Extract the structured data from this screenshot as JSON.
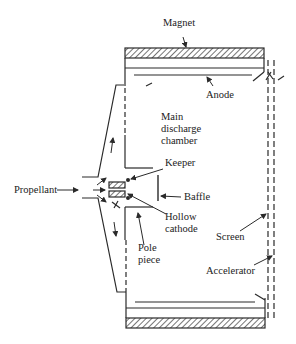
{
  "diagram": {
    "labels": {
      "magnet": "Magnet",
      "anode": "Anode",
      "main_chamber_1": "Main",
      "main_chamber_2": "discharge",
      "main_chamber_3": "chamber",
      "keeper": "Keeper",
      "propellant": "Propellant",
      "baffle": "Baffle",
      "hollow_cathode_1": "Hollow",
      "hollow_cathode_2": "cathode",
      "pole_piece_1": "Pole",
      "pole_piece_2": "piece",
      "screen": "Screen",
      "accelerator": "Accelerator"
    },
    "colors": {
      "line": "#2a2a2a",
      "background": "#ffffff"
    }
  }
}
